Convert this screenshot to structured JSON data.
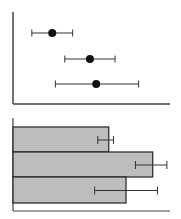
{
  "chart_data": [
    {
      "type": "scatter",
      "title": "",
      "xlabel": "",
      "ylabel": "",
      "grid": false,
      "legend": null,
      "xlim": [
        0,
        100
      ],
      "categories": [
        "A",
        "B",
        "C"
      ],
      "points": [
        {
          "y_index": 0,
          "x": 25,
          "err_low": 12,
          "err_high": 38
        },
        {
          "y_index": 1,
          "x": 49,
          "err_low": 33,
          "err_high": 65
        },
        {
          "y_index": 2,
          "x": 53,
          "err_low": 27,
          "err_high": 80
        }
      ],
      "style": {
        "marker_color": "#111111",
        "errorbar_color": "#333333"
      }
    },
    {
      "type": "bar",
      "orientation": "horizontal",
      "title": "",
      "xlabel": "",
      "ylabel": "",
      "grid": false,
      "legend": null,
      "xlim": [
        0,
        100
      ],
      "categories": [
        "A",
        "B",
        "C"
      ],
      "values": [
        61,
        89,
        72
      ],
      "errors": [
        {
          "low": 54,
          "high": 64
        },
        {
          "low": 78,
          "high": 98
        },
        {
          "low": 52,
          "high": 92
        }
      ],
      "style": {
        "bar_color": "#bdbdbd",
        "edge_color": "#222222",
        "errorbar_color": "#333333"
      }
    }
  ]
}
